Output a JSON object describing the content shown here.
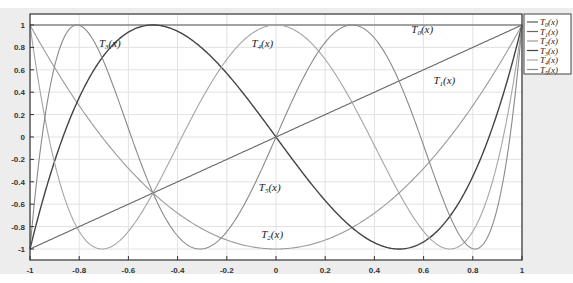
{
  "chart_data": {
    "type": "line",
    "title": "",
    "xlabel": "",
    "ylabel": "",
    "xlim": [
      -1,
      1
    ],
    "ylim": [
      -1.1,
      1.1
    ],
    "grid": true,
    "legend_position": "outside-right-top",
    "x_ticks": [
      "-1",
      "-0.8",
      "-0.6",
      "-0.4",
      "-0.2",
      "0",
      "0.2",
      "0.4",
      "0.6",
      "0.8",
      "1"
    ],
    "y_ticks": [
      "1",
      "0.8",
      "0.6",
      "0.4",
      "0.2",
      "0",
      "-0.2",
      "-0.4",
      "-0.6",
      "-0.8",
      "-1"
    ],
    "series": [
      {
        "name": "T0(x)",
        "formula": "1",
        "color": "#555555"
      },
      {
        "name": "T1(x)",
        "formula": "x",
        "color": "#666666"
      },
      {
        "name": "T2(x)",
        "formula": "2x^2-1",
        "color": "#9a9a9a"
      },
      {
        "name": "T3(x)",
        "formula": "4x^3-3x",
        "color": "#444444"
      },
      {
        "name": "T4(x)",
        "formula": "8x^4-8x^2+1",
        "color": "#a5a5a5"
      },
      {
        "name": "T5(x)",
        "formula": "16x^5-20x^3+5x",
        "color": "#8a8a8a"
      }
    ],
    "annotations": [
      {
        "text": "T3(x)",
        "sub": "3",
        "x": -0.72,
        "y": 0.8
      },
      {
        "text": "T4(x)",
        "sub": "4",
        "x": -0.1,
        "y": 0.8
      },
      {
        "text": "T0(x)",
        "sub": "0",
        "x": 0.55,
        "y": 0.93
      },
      {
        "text": "T1(x)",
        "sub": "1",
        "x": 0.64,
        "y": 0.47
      },
      {
        "text": "T5(x)",
        "sub": "5",
        "x": -0.07,
        "y": -0.48
      },
      {
        "text": "T2(x)",
        "sub": "2",
        "x": -0.06,
        "y": -0.9
      }
    ]
  },
  "legend": {
    "items": [
      {
        "label_main": "T",
        "sub": "0",
        "label_tail": "(x)"
      },
      {
        "label_main": "T",
        "sub": "1",
        "label_tail": "(x)"
      },
      {
        "label_main": "T",
        "sub": "2",
        "label_tail": "(x)"
      },
      {
        "label_main": "T",
        "sub": "3",
        "label_tail": "(x)"
      },
      {
        "label_main": "T",
        "sub": "4",
        "label_tail": "(x)"
      },
      {
        "label_main": "T",
        "sub": "5",
        "label_tail": "(x)"
      }
    ]
  }
}
